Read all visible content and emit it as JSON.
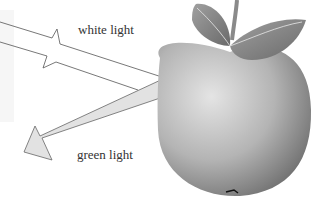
{
  "labels": {
    "white_light": "white light",
    "green_light": "green light"
  },
  "colors": {
    "arrow_fill": "#e2e2e2",
    "arrow_stroke": "#666666",
    "apple_light": "#d8d8d8",
    "apple_dark": "#7a7a7a",
    "leaf": "#8a8a8a"
  }
}
